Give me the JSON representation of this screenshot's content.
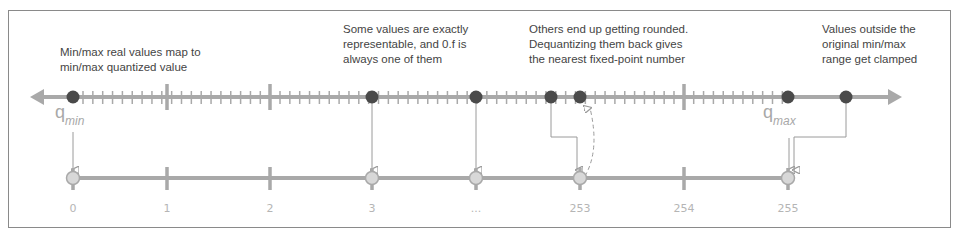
{
  "annotations": {
    "minmax": "Min/max real values map to\nmin/max quantized value",
    "exact": "Some values are exactly\nrepresentable, and 0.f is\nalways one of them",
    "rounded": "Others end up getting rounded.\nDequantizing them back gives\nthe nearest fixed-point number",
    "clamped": "Values outside the\noriginal min/max\nrange get clamped"
  },
  "labels": {
    "q_min_base": "q",
    "q_min_sub": "min",
    "q_max_base": "q",
    "q_max_sub": "max"
  },
  "quantized_axis": {
    "ticks": [
      "0",
      "1",
      "2",
      "3",
      "...",
      "253",
      "254",
      "255"
    ]
  },
  "colors": {
    "line": "#a9a9a9",
    "dot_dark": "#4a4a4a",
    "dot_light": "#d8d8d8",
    "arrow": "#9a9a9a",
    "text": "#444444",
    "muted_text": "#b5b5b5"
  }
}
